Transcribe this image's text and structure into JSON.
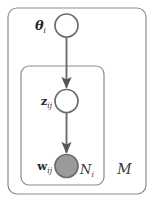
{
  "diagram": {
    "background_color": "#ffffff",
    "stroke_color": "#6b6b6b",
    "label_color": "#2b2b2b",
    "observed_fill": "#9a9a9a"
  },
  "nodes": [
    {
      "id": "theta",
      "label_main": "θ",
      "label_sub": "i",
      "state": "latent",
      "fill": "#ffffff",
      "cx": 66.5,
      "cy": 25.5,
      "r": 11.5
    },
    {
      "id": "z",
      "label_main": "z",
      "label_sub": "ij",
      "state": "latent",
      "fill": "#ffffff",
      "cx": 66.5,
      "cy": 101,
      "r": 11.5
    },
    {
      "id": "w",
      "label_main": "w",
      "label_sub": "ij",
      "state": "observed",
      "fill": "#9a9a9a",
      "cx": 66.5,
      "cy": 166,
      "r": 11.5
    }
  ],
  "edges": [
    {
      "id": "theta-to-z",
      "from": "theta",
      "to": "z"
    },
    {
      "id": "z-to-w",
      "from": "z",
      "to": "w"
    }
  ],
  "plates": [
    {
      "id": "inner-plate",
      "label": "N",
      "label_sub": "i",
      "x": 21,
      "y": 66,
      "width": 83,
      "height": 119
    },
    {
      "id": "outer-plate",
      "label": "M",
      "label_sub": "",
      "x": 8,
      "y": 8,
      "width": 138,
      "height": 186
    }
  ]
}
